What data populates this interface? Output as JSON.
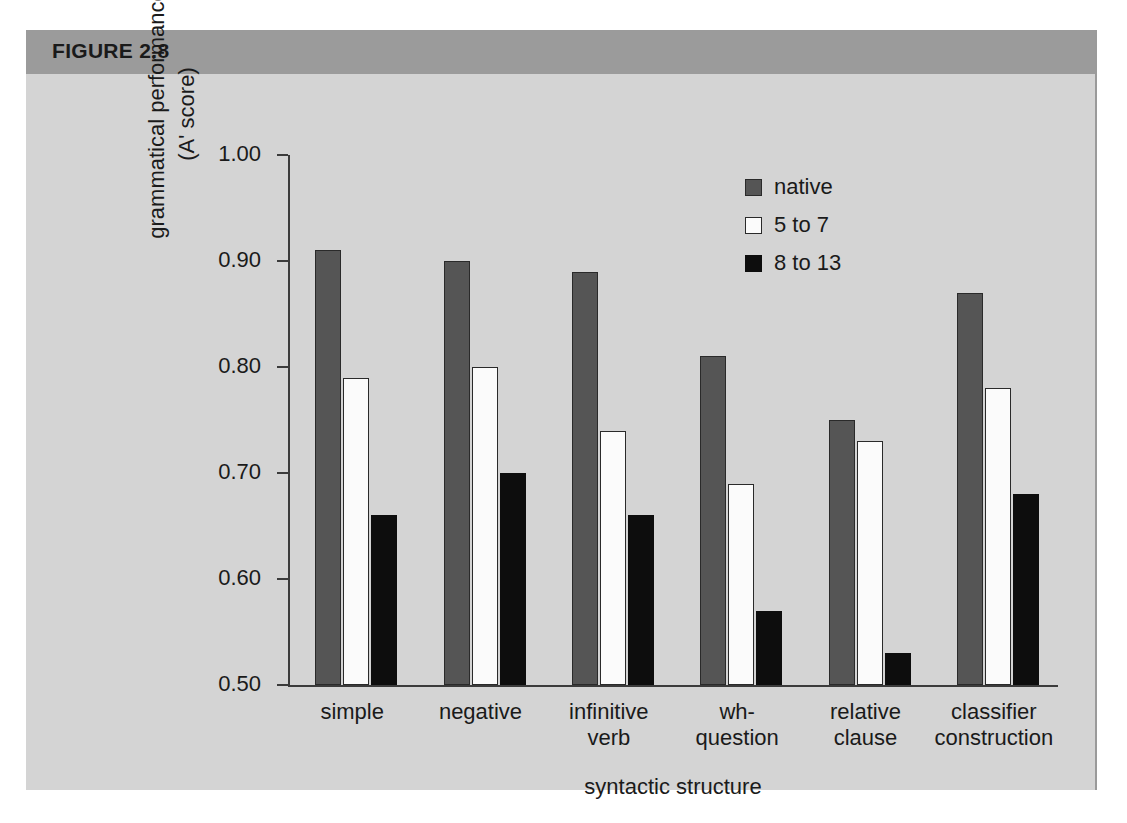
{
  "figure": {
    "label": "FIGURE 2.8"
  },
  "chart_data": {
    "type": "bar",
    "title": "",
    "xlabel": "syntactic structure",
    "ylabel_line1": "grammatical performance",
    "ylabel_line2": "(A' score)",
    "ylim": [
      0.5,
      1.0
    ],
    "ytick_labels": [
      "1.00",
      "0.90",
      "0.80",
      "0.70",
      "0.60",
      "0.50"
    ],
    "ytick_values": [
      1.0,
      0.9,
      0.8,
      0.7,
      0.6,
      0.5
    ],
    "grid": false,
    "legend_position": "top-right",
    "categories": [
      "simple",
      "negative",
      "infinitive verb",
      "wh- question",
      "relative clause",
      "classifier construction"
    ],
    "category_lines": [
      [
        "simple"
      ],
      [
        "negative"
      ],
      [
        "infinitive",
        "verb"
      ],
      [
        "wh-",
        "question"
      ],
      [
        "relative",
        "clause"
      ],
      [
        "classifier",
        "construction"
      ]
    ],
    "series": [
      {
        "name": "native",
        "color": "#555555",
        "values": [
          0.91,
          0.9,
          0.89,
          0.81,
          0.75,
          0.87
        ]
      },
      {
        "name": "5 to 7",
        "color": "#fbfbfb",
        "values": [
          0.79,
          0.8,
          0.74,
          0.69,
          0.73,
          0.78
        ]
      },
      {
        "name": "8 to 13",
        "color": "#0d0d0d",
        "values": [
          0.66,
          0.7,
          0.66,
          0.57,
          0.53,
          0.68
        ]
      }
    ]
  }
}
